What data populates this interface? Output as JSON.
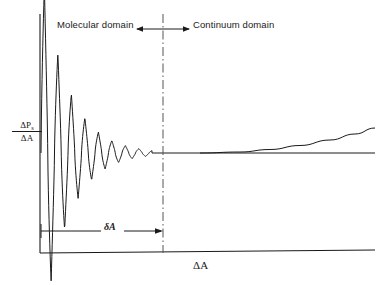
{
  "figure": {
    "background_color": "#ffffff",
    "line_color": "#1a1a1a"
  },
  "annotations": {
    "molecular_domain": "Molecular domain",
    "continuum_domain": "Continuum domain",
    "delta_a_span": "δA",
    "x_axis_label": "ΔA",
    "y_axis_numerator": "ΔP",
    "y_axis_numerator_sub": "s",
    "y_axis_denominator": "ΔA"
  },
  "chart_data": {
    "type": "line",
    "title": "",
    "xlabel": "ΔA",
    "ylabel": "ΔP_s/ΔA",
    "grid": false,
    "legend": "none",
    "axis_origin_px": [
      40,
      253
    ],
    "axis_extent_px": [
      375,
      14
    ],
    "equilibrium_level_px_y": 153,
    "domain_divider_px_x": 163,
    "series": [
      {
        "name": "oscillatory-structural-force",
        "style": "solid",
        "comment": "Damped oscillation about the equilibrium level; amplitude decays exponentially from the axis to the divider.",
        "x_start": 41,
        "x_end": 152,
        "baseline": 153,
        "amplitude_start": 190,
        "decay_length": 26,
        "period_start": 13.5,
        "period_growth": 0.0
      },
      {
        "name": "continuum-plateau",
        "style": "solid",
        "comment": "Flat horizontal asymptote at the equilibrium level across the continuum domain.",
        "points": [
          [
            152,
            153
          ],
          [
            375,
            153
          ]
        ]
      },
      {
        "name": "continuum-rising-branch",
        "style": "solid",
        "comment": "Second branch departing upward from the plateau toward the right edge.",
        "points": [
          [
            200,
            153
          ],
          [
            240,
            152
          ],
          [
            270,
            149.5
          ],
          [
            300,
            145.5
          ],
          [
            330,
            140
          ],
          [
            355,
            134
          ],
          [
            375,
            128
          ]
        ]
      },
      {
        "name": "axis-x-baseline-drift",
        "style": "solid",
        "comment": "Horizontal baseline axis extending to the right edge.",
        "points": [
          [
            40,
            253
          ],
          [
            375,
            250
          ]
        ]
      }
    ],
    "markers": [
      {
        "name": "domain-divider",
        "type": "vertical-dash-dot-line",
        "x": 163,
        "y_top": 14,
        "y_bottom": 253
      },
      {
        "name": "delta-a-dimension-arrow",
        "type": "horizontal-arrow",
        "x_start": 41,
        "x_end": 163,
        "y": 231,
        "arrowhead": "right"
      },
      {
        "name": "molecular-domain-arrow",
        "type": "horizontal-arrow",
        "x_start": 163,
        "x_end": 137,
        "y": 29,
        "arrowhead": "left"
      },
      {
        "name": "continuum-domain-arrow",
        "type": "horizontal-arrow",
        "x_start": 163,
        "x_end": 189,
        "y": 29,
        "arrowhead": "right"
      }
    ]
  }
}
